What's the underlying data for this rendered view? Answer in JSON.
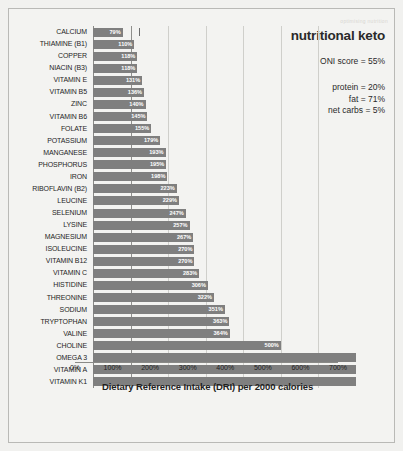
{
  "watermark": "optimising nutrition",
  "info_panel": {
    "title": "nutritional keto",
    "oni_score": "ONI score = 55%",
    "macros": [
      "protein = 20%",
      "fat = 71%",
      "net carbs = 5%"
    ]
  },
  "chart_data": {
    "type": "bar",
    "orientation": "horizontal",
    "title": "nutritional keto",
    "xlabel": "Dietary Reference Intake (DRI) per 2000 calories",
    "ylabel": "",
    "xlim": [
      0,
      700
    ],
    "xticks": [
      "0%",
      "100%",
      "200%",
      "300%",
      "400%",
      "500%",
      "600%",
      "700%"
    ],
    "xtick_values": [
      0,
      100,
      200,
      300,
      400,
      500,
      600,
      700
    ],
    "grid": true,
    "reference_line": 100,
    "legend": "none",
    "bar_color": "#7f7f7f",
    "background_color": "#f3f3f1",
    "categories": [
      "CALCIUM",
      "THIAMINE (B1)",
      "COPPER",
      "NIACIN (B3)",
      "VITAMIN E",
      "VITAMIN B5",
      "ZINC",
      "VITAMIN B6",
      "FOLATE",
      "POTASSIUM",
      "MANGANESE",
      "PHOSPHORUS",
      "IRON",
      "RIBOFLAVIN (B2)",
      "LEUCINE",
      "SELENIUM",
      "LYSINE",
      "MAGNESIUM",
      "ISOLEUCINE",
      "VITAMIN B12",
      "VITAMIN C",
      "HISTIDINE",
      "THREONINE",
      "SODIUM",
      "TRYPTOPHAN",
      "VALINE",
      "CHOLINE",
      "OMEGA 3",
      "VITAMIN A",
      "VITAMIN K1"
    ],
    "values": [
      79,
      110,
      118,
      118,
      131,
      136,
      140,
      145,
      155,
      179,
      193,
      195,
      198,
      223,
      229,
      247,
      257,
      267,
      270,
      270,
      283,
      306,
      322,
      351,
      363,
      364,
      500,
      720,
      720,
      720
    ],
    "value_labels": [
      "79%",
      "110%",
      "118%",
      "118%",
      "131%",
      "136%",
      "140%",
      "145%",
      "155%",
      "179%",
      "193%",
      "195%",
      "198%",
      "223%",
      "229%",
      "247%",
      "257%",
      "267%",
      "270%",
      "270%",
      "283%",
      "306%",
      "322%",
      "351%",
      "363%",
      "364%",
      "500%",
      "",
      "",
      ""
    ]
  }
}
